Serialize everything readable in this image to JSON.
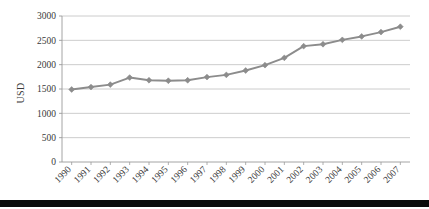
{
  "chart_data": {
    "type": "line",
    "title": "",
    "subtitle": "",
    "xlabel": "",
    "ylabel": "USD",
    "categories": [
      "1990",
      "1991",
      "1992",
      "1993",
      "1994",
      "1995",
      "1996",
      "1997",
      "1998",
      "1999",
      "2000",
      "2001",
      "2002",
      "2003",
      "2004",
      "2005",
      "2006",
      "2007"
    ],
    "values": [
      1490,
      1540,
      1590,
      1735,
      1680,
      1670,
      1680,
      1745,
      1790,
      1880,
      1990,
      2140,
      2380,
      2420,
      2510,
      2580,
      2670,
      2780
    ],
    "series": [
      {
        "name": "USD",
        "values": [
          1490,
          1540,
          1590,
          1735,
          1680,
          1670,
          1680,
          1745,
          1790,
          1880,
          1990,
          2140,
          2380,
          2420,
          2510,
          2580,
          2670,
          2780
        ]
      }
    ],
    "ylim": [
      0,
      3000
    ],
    "yticks": [
      0,
      500,
      1000,
      1500,
      2000,
      2500,
      3000
    ],
    "ytick_labels": [
      "0",
      "500",
      "1000",
      "1500",
      "2000",
      "2500",
      "3000"
    ],
    "grid": "horizontal",
    "legend": "none",
    "marker": "diamond",
    "line_color": "#8c8c8c",
    "marker_color": "#8c8c8c",
    "grid_color": "#bfbfbf",
    "axis_color": "#9a9a9a",
    "text_color": "#3a3a3a",
    "xtick_rotation": -45,
    "annotations": []
  },
  "decor": {
    "bottom_bar_color": "#0b0b0b"
  }
}
